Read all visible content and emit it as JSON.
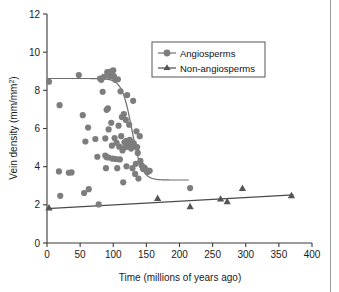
{
  "chart_data": {
    "type": "scatter",
    "title": "",
    "xlabel": "Time (millions of years ago)",
    "ylabel": "Vein density (mm/mm²)",
    "ylabel_base": "Vein density (mm/mm",
    "ylabel_sup": "2",
    "ylabel_tail": ")",
    "xlim": [
      0,
      400
    ],
    "ylim": [
      0,
      12
    ],
    "xticks": [
      0,
      50,
      100,
      150,
      200,
      250,
      300,
      350,
      400
    ],
    "yticks": [
      0,
      2,
      4,
      6,
      8,
      10,
      12
    ],
    "xtick_labels": [
      "0",
      "50",
      "100",
      "150",
      "200",
      "250",
      "300",
      "350",
      "400"
    ],
    "ytick_labels": [
      "0",
      "2",
      "4",
      "6",
      "8",
      "10",
      "12"
    ],
    "grid": false,
    "legend_position": "top-right",
    "series": [
      {
        "name": "Angiosperms",
        "marker": "circle",
        "color": "#7d7d7d",
        "points": [
          [
            3,
            8.45
          ],
          [
            19,
            7.22
          ],
          [
            20,
            2.47
          ],
          [
            18,
            3.75
          ],
          [
            33,
            3.68
          ],
          [
            37,
            3.7
          ],
          [
            48,
            8.8
          ],
          [
            54,
            6.7
          ],
          [
            56,
            2.62
          ],
          [
            58,
            5.32
          ],
          [
            62,
            6.05
          ],
          [
            63,
            2.82
          ],
          [
            73,
            5.45
          ],
          [
            76,
            4.52
          ],
          [
            78,
            2.02
          ],
          [
            80,
            8.62
          ],
          [
            82,
            8.55
          ],
          [
            84,
            7.92
          ],
          [
            86,
            8.7
          ],
          [
            88,
            5.48
          ],
          [
            88,
            4.58
          ],
          [
            89,
            3.92
          ],
          [
            90,
            6.98
          ],
          [
            90,
            4.5
          ],
          [
            91,
            8.95
          ],
          [
            92,
            7.05
          ],
          [
            93,
            5.95
          ],
          [
            93,
            4.48
          ],
          [
            95,
            8.72
          ],
          [
            96,
            8.98
          ],
          [
            97,
            6.3
          ],
          [
            98,
            5.1
          ],
          [
            99,
            4.42
          ],
          [
            100,
            9.05
          ],
          [
            101,
            8.75
          ],
          [
            102,
            5.5
          ],
          [
            103,
            8.55
          ],
          [
            104,
            4.4
          ],
          [
            105,
            5.25
          ],
          [
            106,
            3.92
          ],
          [
            107,
            8.58
          ],
          [
            108,
            6.15
          ],
          [
            109,
            5.05
          ],
          [
            110,
            4.38
          ],
          [
            111,
            7.95
          ],
          [
            112,
            5.6
          ],
          [
            113,
            6.6
          ],
          [
            114,
            4.85
          ],
          [
            115,
            3.18
          ],
          [
            116,
            6.75
          ],
          [
            117,
            5.28
          ],
          [
            118,
            5.02
          ],
          [
            119,
            6.45
          ],
          [
            120,
            5.35
          ],
          [
            120,
            4.02
          ],
          [
            121,
            7.75
          ],
          [
            122,
            5.18
          ],
          [
            123,
            5.05
          ],
          [
            124,
            6.2
          ],
          [
            125,
            5.4
          ],
          [
            126,
            5.12
          ],
          [
            127,
            4.95
          ],
          [
            128,
            5.28
          ],
          [
            129,
            3.92
          ],
          [
            130,
            7.45
          ],
          [
            131,
            5.22
          ],
          [
            132,
            5.05
          ],
          [
            133,
            3.62
          ],
          [
            134,
            4.15
          ],
          [
            135,
            5.85
          ],
          [
            136,
            5.02
          ],
          [
            137,
            4.72
          ],
          [
            138,
            3.38
          ],
          [
            140,
            5.6
          ],
          [
            141,
            4.3
          ],
          [
            143,
            4.05
          ],
          [
            145,
            3.88
          ],
          [
            147,
            3.95
          ],
          [
            150,
            3.82
          ],
          [
            152,
            3.72
          ],
          [
            155,
            3.78
          ],
          [
            216,
            2.88
          ]
        ],
        "fit_curve": {
          "shape": "sigmoid-descending",
          "upper_plateau": 8.62,
          "lower_plateau": 3.3,
          "midpoint_x": 128,
          "x_start": 0,
          "x_end": 215
        }
      },
      {
        "name": "Non-angiosperms",
        "marker": "triangle",
        "color": "#555555",
        "points": [
          [
            3,
            1.85
          ],
          [
            167,
            2.35
          ],
          [
            216,
            1.92
          ],
          [
            262,
            2.32
          ],
          [
            272,
            2.18
          ],
          [
            295,
            2.88
          ],
          [
            369,
            2.5
          ]
        ],
        "fit_curve": {
          "shape": "linear",
          "x_start": 0,
          "x_end": 372,
          "y_start": 1.8,
          "y_end": 2.52
        }
      }
    ]
  },
  "legend": {
    "items": [
      {
        "label": "Angiosperms",
        "marker": "circle"
      },
      {
        "label": "Non-angiosperms",
        "marker": "triangle"
      }
    ]
  }
}
